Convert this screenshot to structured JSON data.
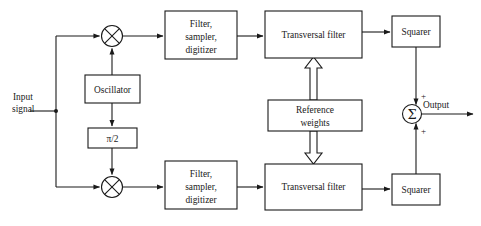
{
  "diagram": {
    "canvas": {
      "width": 481,
      "height": 226,
      "background": "#ffffff",
      "ink": "#1a1a1a"
    },
    "labels": {
      "input_line1": "Input",
      "input_line2": "signal",
      "output": "Output",
      "plus_top": "+",
      "plus_bottom": "+",
      "sigma": "Σ"
    },
    "blocks": [
      {
        "id": "filter-top",
        "lines": [
          "Filter,",
          "sampler,",
          "digitizer"
        ],
        "x": 165,
        "y": 11,
        "w": 72,
        "h": 48
      },
      {
        "id": "transversal-top",
        "lines": [
          "Transversal filter"
        ],
        "x": 265,
        "y": 11,
        "w": 97,
        "h": 47
      },
      {
        "id": "squarer-top",
        "lines": [
          "Squarer"
        ],
        "x": 392,
        "y": 16,
        "w": 48,
        "h": 31
      },
      {
        "id": "oscillator",
        "lines": [
          "Oscillator"
        ],
        "x": 85,
        "y": 75,
        "w": 55,
        "h": 28
      },
      {
        "id": "reference-weights",
        "lines": [
          "Reference",
          "weights"
        ],
        "x": 268,
        "y": 100,
        "w": 94,
        "h": 31
      },
      {
        "id": "phase-shifter",
        "lines": [
          "π/2"
        ],
        "x": 88,
        "y": 128,
        "w": 49,
        "h": 20
      },
      {
        "id": "filter-bottom",
        "lines": [
          "Filter,",
          "sampler,",
          "digitizer"
        ],
        "x": 165,
        "y": 161,
        "w": 72,
        "h": 48
      },
      {
        "id": "transversal-bottom",
        "lines": [
          "Transversal filter"
        ],
        "x": 265,
        "y": 164,
        "w": 97,
        "h": 46
      },
      {
        "id": "squarer-bottom",
        "lines": [
          "Squarer"
        ],
        "x": 392,
        "y": 174,
        "w": 48,
        "h": 31
      }
    ],
    "mixers": [
      {
        "id": "mixer-top",
        "cx": 112,
        "cy": 36,
        "r": 10.5
      },
      {
        "id": "mixer-bottom",
        "cx": 112,
        "cy": 187,
        "r": 10.5
      }
    ],
    "summer": {
      "id": "summer",
      "cx": 412,
      "cy": 114,
      "r": 9.5
    }
  }
}
